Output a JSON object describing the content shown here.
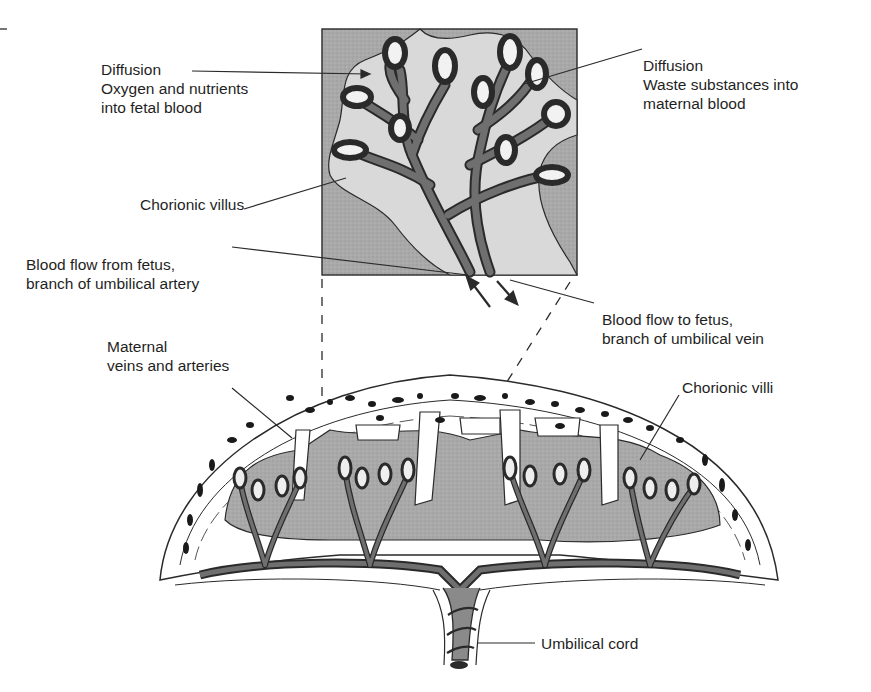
{
  "figure": {
    "inset_view": "Enlarged chorionic villus",
    "main_view": "Cross-section of placenta with umbilical cord"
  },
  "labels": {
    "diffusion_in": {
      "line1": "Diffusion",
      "line2": "Oxygen and nutrients",
      "line3": "into fetal blood"
    },
    "diffusion_out": {
      "line1": "Diffusion",
      "line2": "Waste substances into",
      "line3": "maternal blood"
    },
    "chorionic_villus": {
      "line1": "Chorionic villus"
    },
    "blood_from_fetus": {
      "line1": "Blood flow from fetus,",
      "line2": "branch of umbilical artery"
    },
    "blood_to_fetus": {
      "line1": "Blood flow to fetus,",
      "line2": "branch of umbilical vein"
    },
    "maternal_vessels": {
      "line1": "Maternal",
      "line2": "veins and arteries"
    },
    "chorionic_villi": {
      "line1": "Chorionic villi"
    },
    "umbilical_cord": {
      "line1": "Umbilical cord"
    }
  },
  "colors": {
    "line": "#2a2a2a",
    "maternal_blood_space": "#a9a9a9",
    "villus_tissue": "#d6d6d6",
    "fetal_vessel": "#6f6f6f",
    "vessel_dots": "#1a1a1a",
    "background": "#ffffff"
  }
}
